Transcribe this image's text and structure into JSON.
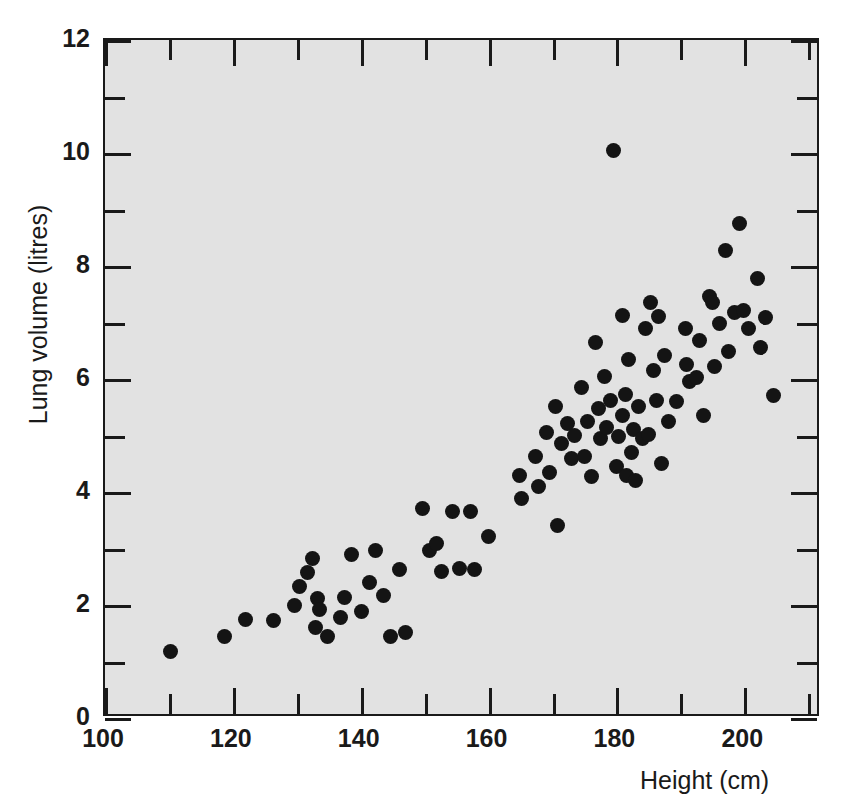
{
  "chart_data": {
    "type": "scatter",
    "title": "",
    "xlabel": "Height (cm)",
    "ylabel": "Lung volume (litres)",
    "xlim": [
      100,
      212
    ],
    "ylim": [
      0,
      12
    ],
    "grid": false,
    "legend": null,
    "x_major_ticks": [
      100,
      120,
      140,
      160,
      180,
      200
    ],
    "x_minor_ticks": [
      110,
      130,
      150,
      170,
      190,
      210
    ],
    "y_major_ticks": [
      0,
      2,
      4,
      6,
      8,
      10,
      12
    ],
    "y_minor_ticks": [
      1,
      3,
      5,
      7,
      9,
      11
    ],
    "x_tick_labels": [
      "100",
      "120",
      "140",
      "160",
      "180",
      "200"
    ],
    "y_tick_labels": [
      "0",
      "2",
      "4",
      "6",
      "8",
      "10",
      "12"
    ],
    "marker": "filled-circle",
    "marker_color": "#141414",
    "plot_background": "#e2e2e2",
    "page_background": "#ffffff",
    "axis_color": "#1a1a1a",
    "n_points": 98,
    "series": [
      {
        "name": "Lung volume vs height",
        "points": [
          [
            110.2,
            1.18
          ],
          [
            118.7,
            1.44
          ],
          [
            122.0,
            1.74
          ],
          [
            126.3,
            1.72
          ],
          [
            129.6,
            2.0
          ],
          [
            130.5,
            2.32
          ],
          [
            131.6,
            2.58
          ],
          [
            132.4,
            2.82
          ],
          [
            133.0,
            1.6
          ],
          [
            133.3,
            2.12
          ],
          [
            133.6,
            1.92
          ],
          [
            134.8,
            1.45
          ],
          [
            136.8,
            1.78
          ],
          [
            137.5,
            2.13
          ],
          [
            138.6,
            2.89
          ],
          [
            140.2,
            1.88
          ],
          [
            141.3,
            2.4
          ],
          [
            142.3,
            2.96
          ],
          [
            143.6,
            2.16
          ],
          [
            144.7,
            1.45
          ],
          [
            146.0,
            2.63
          ],
          [
            147.0,
            1.52
          ],
          [
            149.7,
            3.71
          ],
          [
            150.7,
            2.96
          ],
          [
            151.8,
            3.08
          ],
          [
            152.6,
            2.6
          ],
          [
            154.3,
            3.65
          ],
          [
            155.4,
            2.64
          ],
          [
            157.2,
            3.65
          ],
          [
            157.8,
            2.63
          ],
          [
            160.0,
            3.22
          ],
          [
            164.9,
            4.3
          ],
          [
            165.2,
            3.88
          ],
          [
            167.4,
            4.62
          ],
          [
            167.8,
            4.1
          ],
          [
            169.0,
            5.05
          ],
          [
            169.6,
            4.35
          ],
          [
            170.5,
            5.52
          ],
          [
            170.8,
            3.4
          ],
          [
            171.4,
            4.86
          ],
          [
            172.3,
            5.22
          ],
          [
            173.0,
            4.6
          ],
          [
            173.5,
            5.0
          ],
          [
            174.6,
            5.85
          ],
          [
            175.0,
            4.62
          ],
          [
            175.4,
            5.25
          ],
          [
            176.1,
            4.28
          ],
          [
            176.8,
            6.65
          ],
          [
            177.2,
            5.48
          ],
          [
            177.5,
            4.95
          ],
          [
            178.2,
            6.05
          ],
          [
            178.4,
            5.14
          ],
          [
            179.0,
            5.62
          ],
          [
            179.6,
            10.05
          ],
          [
            180.0,
            4.46
          ],
          [
            180.3,
            4.98
          ],
          [
            180.9,
            5.36
          ],
          [
            181.0,
            7.12
          ],
          [
            181.4,
            5.72
          ],
          [
            181.6,
            4.3
          ],
          [
            181.9,
            6.35
          ],
          [
            182.3,
            4.7
          ],
          [
            182.7,
            5.1
          ],
          [
            183.0,
            4.2
          ],
          [
            183.4,
            5.52
          ],
          [
            184.0,
            4.95
          ],
          [
            184.5,
            6.9
          ],
          [
            185.0,
            5.02
          ],
          [
            185.4,
            7.35
          ],
          [
            185.8,
            6.15
          ],
          [
            186.2,
            5.62
          ],
          [
            186.6,
            7.1
          ],
          [
            187.0,
            4.5
          ],
          [
            187.5,
            6.42
          ],
          [
            188.2,
            5.24
          ],
          [
            189.4,
            5.6
          ],
          [
            190.8,
            6.9
          ],
          [
            191.0,
            6.25
          ],
          [
            191.5,
            5.95
          ],
          [
            192.6,
            6.02
          ],
          [
            193.0,
            6.68
          ],
          [
            193.6,
            5.35
          ],
          [
            194.6,
            7.46
          ],
          [
            195.0,
            7.35
          ],
          [
            195.4,
            6.22
          ],
          [
            196.2,
            6.98
          ],
          [
            197.0,
            8.28
          ],
          [
            197.6,
            6.48
          ],
          [
            198.4,
            7.18
          ],
          [
            199.2,
            8.76
          ],
          [
            199.8,
            7.22
          ],
          [
            200.6,
            6.9
          ],
          [
            202.0,
            7.78
          ],
          [
            202.6,
            6.56
          ],
          [
            203.3,
            7.08
          ],
          [
            204.5,
            5.7
          ]
        ]
      }
    ]
  },
  "figure": {
    "ylabel": "Lung volume (litres)",
    "xlabel": "Height (cm)"
  }
}
